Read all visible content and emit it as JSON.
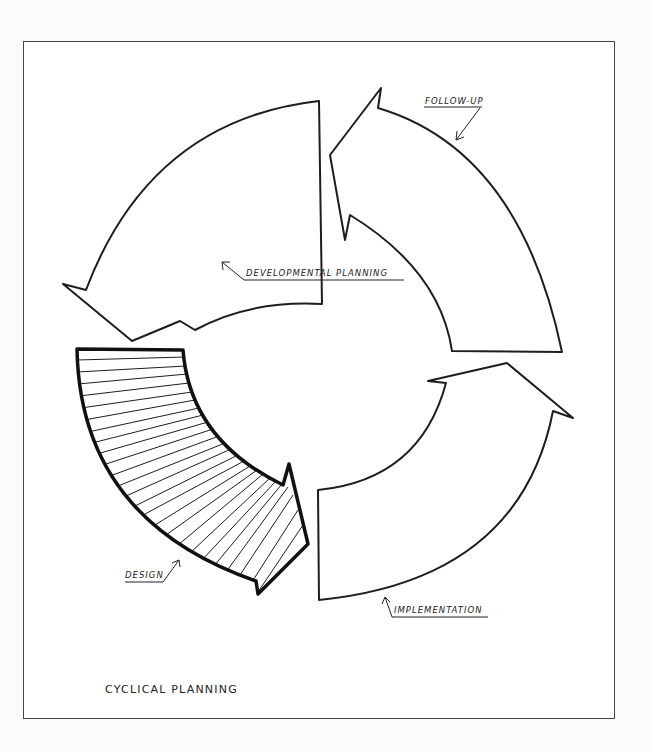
{
  "diagram": {
    "title": "CYCLICAL PLANNING",
    "stages": [
      {
        "id": "developmental-planning",
        "label": "DEVELOPMENTAL PLANNING",
        "position": "top-left",
        "hatched": false
      },
      {
        "id": "follow-up",
        "label": "FOLLOW-UP",
        "position": "top-right",
        "hatched": false
      },
      {
        "id": "implementation",
        "label": "IMPLEMENTATION",
        "position": "bottom-right",
        "hatched": false
      },
      {
        "id": "design",
        "label": "DESIGN",
        "position": "bottom-left",
        "hatched": true
      }
    ],
    "flow": "counter-clockwise cycle of four curved arrows",
    "colors": {
      "line": "#1e1e1e",
      "background": "#ffffff",
      "frame": "#444444"
    }
  }
}
